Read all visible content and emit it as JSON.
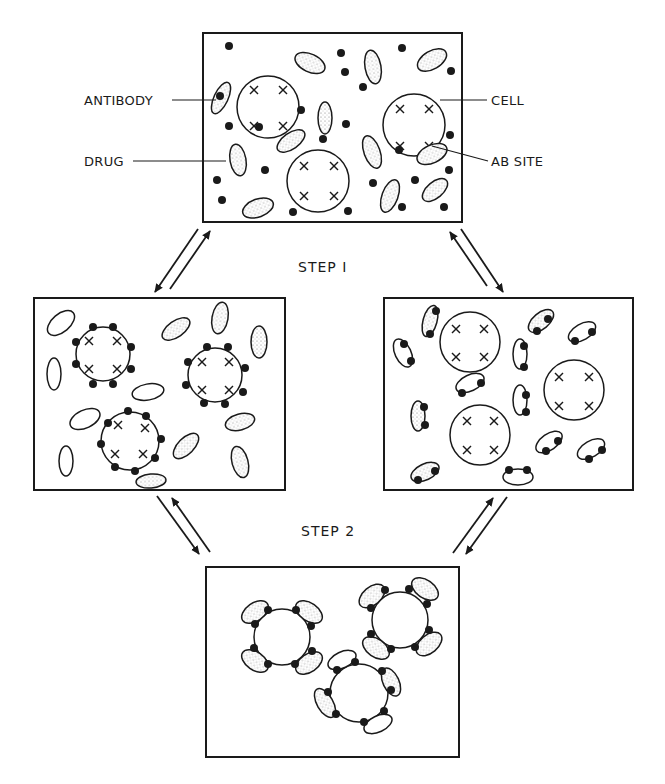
{
  "figure": {
    "labels": {
      "antibody": "ANTIBODY",
      "drug": "DRUG",
      "cell": "CELL",
      "ab_site": "AB SITE"
    },
    "steps": {
      "step1": "STEP I",
      "step2": "STEP 2"
    },
    "panels": [
      {
        "id": "top",
        "content": "Free cells with AB sites, free antibodies, free drug molecules"
      },
      {
        "id": "left",
        "content": "Drug molecules bound around cell surfaces; free antibodies"
      },
      {
        "id": "right",
        "content": "Drug molecules bound to antibodies; free cells with AB sites"
      },
      {
        "id": "bottom",
        "content": "Antibody-drug complexes bound to cells"
      }
    ],
    "colors": {
      "ink": "#1a1a1a",
      "background": "#ffffff"
    }
  }
}
